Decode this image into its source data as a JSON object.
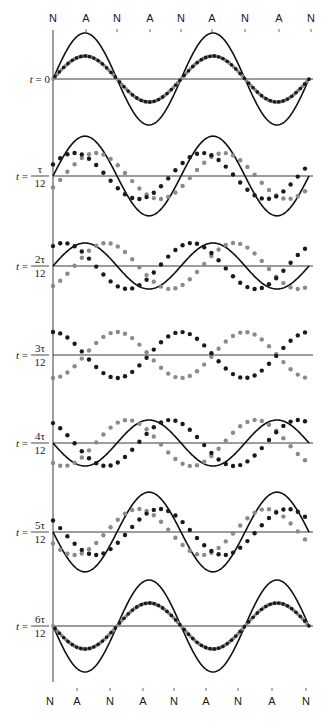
{
  "figure": {
    "top_labels": [
      "N",
      "A",
      "N",
      "A",
      "N",
      "A",
      "N",
      "A",
      "N"
    ],
    "bottom_labels": [
      "N",
      "A",
      "N",
      "A",
      "N",
      "A",
      "N",
      "A",
      "N"
    ],
    "node_label": "N",
    "antinode_label": "A",
    "colors": {
      "resultant": "#111111",
      "wave_forward": "#1a1a1a",
      "wave_backward": "#8a8a8a",
      "axis": "#3a3a3a"
    },
    "rows": [
      {
        "label_prefix": "t = ",
        "label_text": "0",
        "fraction": false,
        "numerator": "",
        "denominator": "",
        "phase_deg": 0,
        "baseline_y": 79,
        "dense": true
      },
      {
        "label_prefix": "t = ",
        "label_text": "",
        "fraction": true,
        "numerator": "τ",
        "denominator": "12",
        "phase_deg": 30,
        "baseline_y": 176,
        "dense": false
      },
      {
        "label_prefix": "t = ",
        "label_text": "",
        "fraction": true,
        "numerator": "2τ",
        "denominator": "12",
        "phase_deg": 60,
        "baseline_y": 266,
        "dense": false
      },
      {
        "label_prefix": "t = ",
        "label_text": "",
        "fraction": true,
        "numerator": "3τ",
        "denominator": "12",
        "phase_deg": 90,
        "baseline_y": 355,
        "dense": false
      },
      {
        "label_prefix": "t = ",
        "label_text": "",
        "fraction": true,
        "numerator": "4τ",
        "denominator": "12",
        "phase_deg": 120,
        "baseline_y": 443,
        "dense": false
      },
      {
        "label_prefix": "t = ",
        "label_text": "",
        "fraction": true,
        "numerator": "5τ",
        "denominator": "12",
        "phase_deg": 150,
        "baseline_y": 532,
        "dense": false
      },
      {
        "label_prefix": "t = ",
        "label_text": "",
        "fraction": true,
        "numerator": "6τ",
        "denominator": "12",
        "phase_deg": 180,
        "baseline_y": 626,
        "dense": true
      }
    ],
    "geometry": {
      "x_start": 53,
      "x_end": 309,
      "axis_line_end": 313,
      "wavelength_px": 128,
      "component_amplitude_px": 23,
      "vertical_axis_top": 30,
      "vertical_axis_bottom": 682,
      "top_label_y": 22,
      "top_tick_y": 29,
      "top_label_x": [
        53,
        86,
        117,
        150,
        181,
        212,
        245,
        279,
        311
      ],
      "bottom_label_y": 705,
      "bottom_tick_y": 688,
      "bottom_label_x": [
        50,
        77,
        110,
        143,
        174,
        206,
        238,
        272,
        306
      ]
    }
  }
}
